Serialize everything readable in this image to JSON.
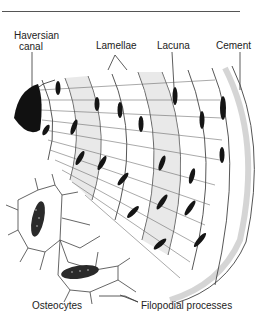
{
  "diagram": {
    "type": "anatomical illustration",
    "labels": {
      "haversian_canal_line1": "Haversian",
      "haversian_canal_line2": "canal",
      "lamellae": "Lamellae",
      "lacuna": "Lacuna",
      "cement": "Cement",
      "osteocytes": "Osteocytes",
      "filopodial_processes": "Filopodial processes"
    },
    "colors": {
      "ink": "#1a1a1a",
      "line": "#555555",
      "shade": "#cfcfcf",
      "background": "#ffffff"
    }
  }
}
